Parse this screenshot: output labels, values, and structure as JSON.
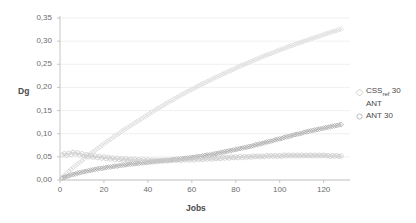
{
  "chart_data": {
    "type": "scatter",
    "title": "",
    "xlabel": "Jobs",
    "ylabel": "Dg",
    "xlim": [
      0,
      132
    ],
    "ylim": [
      0,
      0.35
    ],
    "xticks": [
      "0",
      "20",
      "40",
      "60",
      "80",
      "100",
      "120"
    ],
    "xtick_values": [
      0,
      20,
      40,
      60,
      80,
      100,
      120
    ],
    "yticks": [
      "0,00",
      "0,05",
      "0,10",
      "0,15",
      "0,20",
      "0,25",
      "0,30",
      "0,35"
    ],
    "ytick_values": [
      0,
      0.05,
      0.1,
      0.15,
      0.2,
      0.25,
      0.3,
      0.35
    ],
    "grid": true,
    "legend_position": "right",
    "colors": {
      "css_ref_30": "#d9d9d9",
      "ant": "#a6a6a6",
      "ant_30": "#c9c9c9",
      "axis": "#bfbfbf",
      "grid": "#ececec",
      "text": "#595959"
    },
    "series": [
      {
        "name": "CSS",
        "name_sub": "ref",
        "name_suffix": "30",
        "label": "CSS ref 30",
        "marker": "diamond",
        "color": "#d9d9d9",
        "x": [
          1,
          2,
          3,
          4,
          5,
          6,
          7,
          8,
          9,
          10,
          11,
          12,
          13,
          14,
          15,
          16,
          17,
          18,
          19,
          20,
          21,
          22,
          23,
          24,
          25,
          26,
          27,
          28,
          29,
          30,
          31,
          32,
          33,
          34,
          35,
          36,
          37,
          38,
          39,
          40,
          41,
          42,
          43,
          44,
          45,
          46,
          47,
          48,
          49,
          50,
          51,
          52,
          53,
          54,
          55,
          56,
          57,
          58,
          59,
          60,
          61,
          62,
          63,
          64,
          65,
          66,
          67,
          68,
          69,
          70,
          71,
          72,
          73,
          74,
          75,
          76,
          77,
          78,
          79,
          80,
          81,
          82,
          83,
          84,
          85,
          86,
          87,
          88,
          89,
          90,
          91,
          92,
          93,
          94,
          95,
          96,
          97,
          98,
          99,
          100,
          101,
          102,
          103,
          104,
          105,
          106,
          107,
          108,
          109,
          110,
          111,
          112,
          113,
          114,
          115,
          116,
          117,
          118,
          119,
          120,
          121,
          122,
          123,
          124,
          125,
          126,
          127,
          128
        ],
        "y": [
          0.006,
          0.01,
          0.014,
          0.019,
          0.023,
          0.027,
          0.031,
          0.035,
          0.038,
          0.042,
          0.046,
          0.05,
          0.054,
          0.057,
          0.061,
          0.064,
          0.068,
          0.071,
          0.075,
          0.078,
          0.082,
          0.085,
          0.088,
          0.092,
          0.095,
          0.098,
          0.101,
          0.105,
          0.108,
          0.111,
          0.114,
          0.117,
          0.12,
          0.123,
          0.126,
          0.129,
          0.132,
          0.135,
          0.138,
          0.141,
          0.144,
          0.147,
          0.15,
          0.153,
          0.156,
          0.158,
          0.161,
          0.164,
          0.167,
          0.17,
          0.172,
          0.175,
          0.178,
          0.18,
          0.183,
          0.186,
          0.188,
          0.191,
          0.193,
          0.196,
          0.198,
          0.201,
          0.203,
          0.206,
          0.208,
          0.21,
          0.213,
          0.215,
          0.217,
          0.22,
          0.222,
          0.224,
          0.226,
          0.229,
          0.231,
          0.233,
          0.235,
          0.237,
          0.239,
          0.242,
          0.244,
          0.246,
          0.248,
          0.25,
          0.252,
          0.254,
          0.256,
          0.258,
          0.26,
          0.262,
          0.264,
          0.266,
          0.268,
          0.27,
          0.272,
          0.273,
          0.275,
          0.277,
          0.279,
          0.281,
          0.283,
          0.284,
          0.286,
          0.288,
          0.29,
          0.291,
          0.293,
          0.295,
          0.296,
          0.298,
          0.3,
          0.301,
          0.303,
          0.305,
          0.306,
          0.308,
          0.309,
          0.311,
          0.312,
          0.314,
          0.316,
          0.317,
          0.319,
          0.32,
          0.322,
          0.323,
          0.325,
          0.326
        ]
      },
      {
        "name": "ANT",
        "label": "ANT",
        "marker": "diamond",
        "color": "#a6a6a6",
        "x": [
          1,
          2,
          3,
          4,
          5,
          6,
          7,
          8,
          9,
          10,
          11,
          12,
          13,
          14,
          15,
          16,
          17,
          18,
          19,
          20,
          21,
          22,
          23,
          24,
          25,
          26,
          27,
          28,
          29,
          30,
          31,
          32,
          33,
          34,
          35,
          36,
          37,
          38,
          39,
          40,
          41,
          42,
          43,
          44,
          45,
          46,
          47,
          48,
          49,
          50,
          51,
          52,
          53,
          54,
          55,
          56,
          57,
          58,
          59,
          60,
          61,
          62,
          63,
          64,
          65,
          66,
          67,
          68,
          69,
          70,
          71,
          72,
          73,
          74,
          75,
          76,
          77,
          78,
          79,
          80,
          81,
          82,
          83,
          84,
          85,
          86,
          87,
          88,
          89,
          90,
          91,
          92,
          93,
          94,
          95,
          96,
          97,
          98,
          99,
          100,
          101,
          102,
          103,
          104,
          105,
          106,
          107,
          108,
          109,
          110,
          111,
          112,
          113,
          114,
          115,
          116,
          117,
          118,
          119,
          120,
          121,
          122,
          123,
          124,
          125,
          126,
          127,
          128
        ],
        "y": [
          0.004,
          0.006,
          0.008,
          0.009,
          0.011,
          0.012,
          0.013,
          0.015,
          0.016,
          0.017,
          0.018,
          0.019,
          0.02,
          0.021,
          0.022,
          0.023,
          0.024,
          0.025,
          0.025,
          0.026,
          0.027,
          0.028,
          0.028,
          0.029,
          0.03,
          0.03,
          0.031,
          0.032,
          0.032,
          0.033,
          0.034,
          0.034,
          0.035,
          0.035,
          0.036,
          0.036,
          0.037,
          0.037,
          0.038,
          0.038,
          0.039,
          0.039,
          0.04,
          0.04,
          0.041,
          0.041,
          0.042,
          0.042,
          0.043,
          0.043,
          0.044,
          0.044,
          0.045,
          0.045,
          0.046,
          0.046,
          0.047,
          0.047,
          0.048,
          0.049,
          0.049,
          0.05,
          0.051,
          0.051,
          0.052,
          0.053,
          0.054,
          0.054,
          0.055,
          0.056,
          0.057,
          0.058,
          0.059,
          0.06,
          0.061,
          0.062,
          0.063,
          0.064,
          0.065,
          0.066,
          0.067,
          0.068,
          0.069,
          0.07,
          0.071,
          0.072,
          0.073,
          0.074,
          0.076,
          0.077,
          0.078,
          0.079,
          0.08,
          0.082,
          0.083,
          0.084,
          0.085,
          0.087,
          0.088,
          0.089,
          0.09,
          0.092,
          0.093,
          0.094,
          0.095,
          0.097,
          0.098,
          0.099,
          0.1,
          0.101,
          0.103,
          0.104,
          0.105,
          0.106,
          0.107,
          0.108,
          0.109,
          0.11,
          0.111,
          0.112,
          0.113,
          0.114,
          0.115,
          0.116,
          0.117,
          0.118,
          0.119,
          0.12
        ]
      },
      {
        "name": "ANT 30",
        "label": "ANT 30",
        "marker": "circle",
        "color": "#c9c9c9",
        "x": [
          1,
          2,
          3,
          4,
          5,
          6,
          7,
          8,
          9,
          10,
          11,
          12,
          13,
          14,
          15,
          16,
          17,
          18,
          19,
          20,
          21,
          22,
          23,
          24,
          25,
          26,
          27,
          28,
          29,
          30,
          31,
          32,
          33,
          34,
          35,
          36,
          37,
          38,
          39,
          40,
          41,
          42,
          43,
          44,
          45,
          46,
          47,
          48,
          49,
          50,
          51,
          52,
          53,
          54,
          55,
          56,
          57,
          58,
          59,
          60,
          61,
          62,
          63,
          64,
          65,
          66,
          67,
          68,
          69,
          70,
          71,
          72,
          73,
          74,
          75,
          76,
          77,
          78,
          79,
          80,
          81,
          82,
          83,
          84,
          85,
          86,
          87,
          88,
          89,
          90,
          91,
          92,
          93,
          94,
          95,
          96,
          97,
          98,
          99,
          100,
          101,
          102,
          103,
          104,
          105,
          106,
          107,
          108,
          109,
          110,
          111,
          112,
          113,
          114,
          115,
          116,
          117,
          118,
          119,
          120,
          121,
          122,
          123,
          124,
          125,
          126,
          127,
          128
        ],
        "y": [
          0.054,
          0.057,
          0.053,
          0.058,
          0.055,
          0.06,
          0.056,
          0.059,
          0.054,
          0.057,
          0.052,
          0.055,
          0.05,
          0.053,
          0.049,
          0.052,
          0.048,
          0.051,
          0.047,
          0.05,
          0.046,
          0.049,
          0.045,
          0.048,
          0.044,
          0.047,
          0.044,
          0.046,
          0.043,
          0.046,
          0.043,
          0.045,
          0.042,
          0.045,
          0.042,
          0.044,
          0.042,
          0.044,
          0.041,
          0.044,
          0.041,
          0.043,
          0.041,
          0.043,
          0.041,
          0.043,
          0.041,
          0.043,
          0.041,
          0.043,
          0.042,
          0.044,
          0.042,
          0.044,
          0.042,
          0.045,
          0.043,
          0.045,
          0.043,
          0.046,
          0.043,
          0.046,
          0.044,
          0.046,
          0.044,
          0.047,
          0.045,
          0.047,
          0.045,
          0.048,
          0.046,
          0.048,
          0.046,
          0.049,
          0.047,
          0.049,
          0.047,
          0.05,
          0.048,
          0.05,
          0.048,
          0.051,
          0.048,
          0.051,
          0.049,
          0.051,
          0.049,
          0.052,
          0.05,
          0.052,
          0.05,
          0.052,
          0.05,
          0.053,
          0.051,
          0.053,
          0.051,
          0.053,
          0.051,
          0.053,
          0.051,
          0.054,
          0.052,
          0.054,
          0.052,
          0.054,
          0.052,
          0.054,
          0.052,
          0.054,
          0.052,
          0.054,
          0.052,
          0.054,
          0.052,
          0.054,
          0.052,
          0.054,
          0.052,
          0.054,
          0.052,
          0.053,
          0.051,
          0.053,
          0.051,
          0.053,
          0.051,
          0.052
        ]
      }
    ]
  }
}
